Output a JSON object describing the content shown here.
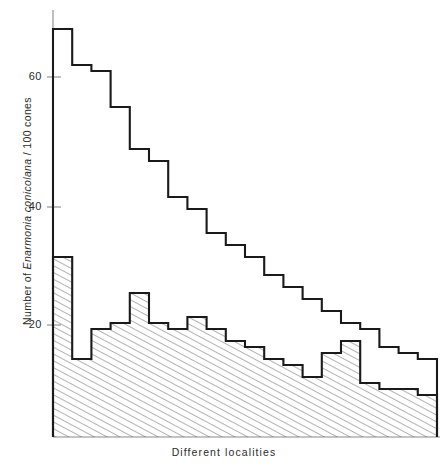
{
  "chart_data": {
    "type": "bar",
    "subtype": "step-histogram-two-series",
    "title": "",
    "xlabel": "Different localities",
    "ylabel": "Number of Enarmonia conicolana / 100 cones",
    "ylabel_parts": {
      "prefix": "Number of ",
      "species": "Enarmonia conicolana",
      "suffix": " / 100 cones"
    },
    "yticks": [
      20,
      40,
      60
    ],
    "ytick_labels": [
      "20",
      "40",
      "60"
    ],
    "ylim": [
      0,
      70
    ],
    "xlim": [
      0,
      20
    ],
    "grid": false,
    "legend": false,
    "categories": [
      "1",
      "2",
      "3",
      "4",
      "5",
      "6",
      "7",
      "8",
      "9",
      "10",
      "11",
      "12",
      "13",
      "14",
      "15",
      "16",
      "17",
      "18",
      "19",
      "20"
    ],
    "series": [
      {
        "name": "Total cones attacked (open step outline)",
        "fill": "none",
        "values": [
          68,
          62,
          61,
          55,
          48,
          46,
          40,
          38,
          34,
          32,
          30,
          27,
          25,
          23,
          21,
          19,
          18,
          15,
          14,
          13
        ]
      },
      {
        "name": "Attacked and emerged (hatched area)",
        "fill": "hatched",
        "values": [
          30,
          13,
          18,
          19,
          24,
          19,
          18,
          20,
          18,
          16,
          15,
          13,
          12,
          10,
          14,
          16,
          9,
          8,
          8,
          7
        ]
      }
    ]
  },
  "colors": {
    "line": "#1a1a1a",
    "axis": "#7a7a7a",
    "hatch": "#555555",
    "background": "#ffffff"
  },
  "axis": {
    "ytick_20": "20",
    "ytick_40": "40",
    "ytick_60": "60"
  }
}
